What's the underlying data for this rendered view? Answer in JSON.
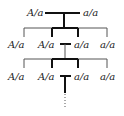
{
  "diagram": {
    "type": "pedigree-inbreeding-chart",
    "generation_1": {
      "left": "A/a",
      "right": "a/a"
    },
    "generation_2": [
      "A/a",
      "A/a",
      "a/a",
      "a/a"
    ],
    "generation_3": [
      "A/a",
      "A/a",
      "a/a",
      "a/a"
    ],
    "continuation": "dotted-line",
    "colors": {
      "line": "#111111",
      "thin_line": "#555555",
      "text": "#222222",
      "background": "#ffffff"
    }
  }
}
